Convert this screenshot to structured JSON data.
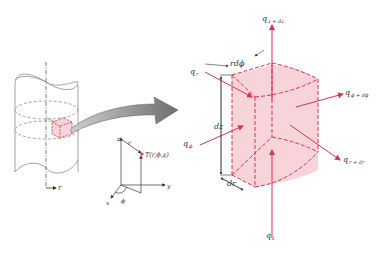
{
  "colors": {
    "accent": "#d6334f",
    "fill": "#f7d3da",
    "line": "#8a8a8a",
    "arrow": "#7a7a7a",
    "text": "#333333"
  },
  "left_figure": {
    "radial_axis_label": "r",
    "coords": {
      "z_label": "z",
      "r_label": "r",
      "point_label": "T(r,ϕ,z)",
      "y_label": "y",
      "x_label": "x",
      "phi_label": "ϕ"
    }
  },
  "element": {
    "dims": {
      "rdphi": "rdϕ",
      "dz": "dz",
      "dr": "dr"
    },
    "fluxes": {
      "q_z_dz": {
        "base": "q",
        "sub": "z + dz"
      },
      "q_r": {
        "base": "q",
        "sub": "r"
      },
      "q_phi": {
        "base": "q",
        "sub": "ϕ"
      },
      "q_phi_dphi": {
        "base": "q",
        "sub": "ϕ + dϕ"
      },
      "q_r_dr": {
        "base": "q",
        "sub": "r + dr"
      },
      "q_z": {
        "base": "q",
        "sub": "z"
      }
    }
  }
}
